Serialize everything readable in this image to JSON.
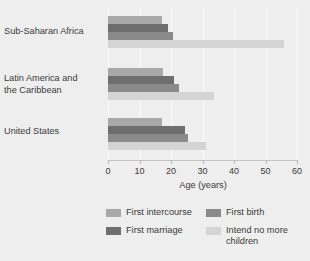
{
  "chart_data": {
    "type": "bar",
    "orientation": "horizontal",
    "title": "",
    "xlabel": "Age (years)",
    "ylabel": "",
    "xlim": [
      0,
      60
    ],
    "xticks": [
      0,
      10,
      20,
      30,
      40,
      50,
      60
    ],
    "xtick_labels": [
      "0",
      "10",
      "20",
      "30",
      "40",
      "50",
      "60"
    ],
    "grid": true,
    "legend_position": "bottom",
    "categories": [
      "Sub-Saharan Africa",
      "Latin America and the Caribbean",
      "United States"
    ],
    "series": [
      {
        "name": "First intercourse",
        "color": "#a8a8a8",
        "values": [
          17.0,
          17.5,
          17.0
        ]
      },
      {
        "name": "First marriage",
        "color": "#6e6e6e",
        "values": [
          19.0,
          21.0,
          24.5
        ]
      },
      {
        "name": "First birth",
        "color": "#8a8a8a",
        "values": [
          20.5,
          22.5,
          25.5
        ]
      },
      {
        "name": "Intend no more children",
        "color": "#d4d4d4",
        "values": [
          56.0,
          33.5,
          31.0
        ]
      }
    ]
  },
  "categories_display": [
    {
      "line1": "Sub-Saharan Africa",
      "line2": ""
    },
    {
      "line1": "Latin America and",
      "line2": "the Caribbean"
    },
    {
      "line1": "United States",
      "line2": ""
    }
  ],
  "legend": {
    "items": [
      {
        "label": "First intercourse",
        "color": "#a8a8a8"
      },
      {
        "label": "First birth",
        "color": "#8a8a8a"
      },
      {
        "label": "First marriage",
        "color": "#6e6e6e"
      },
      {
        "label": "Intend no more children",
        "color": "#d4d4d4"
      }
    ]
  },
  "colors": {
    "background": "#eeeeee",
    "gridline": "#fbfbfb",
    "axis": "#c3c3c3",
    "text": "#3a3a3a"
  }
}
